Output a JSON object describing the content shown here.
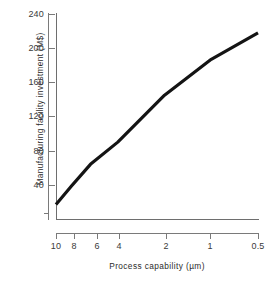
{
  "chart_data": {
    "type": "line",
    "title": "",
    "xlabel": "Process capability (µm)",
    "ylabel": "Manufacturing facility investment (M$)",
    "x_scale": "log-reversed",
    "y_scale": "linear",
    "xlim": [
      10,
      0.5
    ],
    "ylim": [
      0,
      240
    ],
    "grid": false,
    "legend": null,
    "x_ticks": [
      {
        "value": 10,
        "label": "10",
        "px": 56
      },
      {
        "value": 8,
        "label": "8",
        "px": 74
      },
      {
        "value": 6,
        "label": "6",
        "px": 97
      },
      {
        "value": 4,
        "label": "4",
        "px": 119
      },
      {
        "value": 2,
        "label": "2",
        "px": 166
      },
      {
        "value": 1,
        "label": "1",
        "px": 210
      },
      {
        "value": 0.5,
        "label": "0.5",
        "px": 258
      }
    ],
    "y_ticks": [
      {
        "value": 240,
        "label": "240",
        "px": 14
      },
      {
        "value": 200,
        "label": "200",
        "px": 48
      },
      {
        "value": 160,
        "label": "160",
        "px": 82
      },
      {
        "value": 120,
        "label": "120",
        "px": 116
      },
      {
        "value": 80,
        "label": "80",
        "px": 151
      },
      {
        "value": 40,
        "label": "40",
        "px": 185
      }
    ],
    "series": [
      {
        "name": "Manufacturing facility investment",
        "color": "#141414",
        "line_width": 3.2,
        "x": [
          10,
          8,
          6,
          4,
          2,
          1,
          0.5
        ],
        "y": [
          17,
          38,
          64,
          90,
          145,
          187,
          218
        ]
      }
    ],
    "annotations": []
  },
  "axes": {
    "x_title": "Process capability (µm)",
    "y_title": "Manufacturing facility investment (M$)"
  },
  "colors": {
    "line": "#141414",
    "axis": "#6e6e6e",
    "tick": "#7a7a7a",
    "text": "#3a3a3a",
    "background": "#ffffff"
  }
}
